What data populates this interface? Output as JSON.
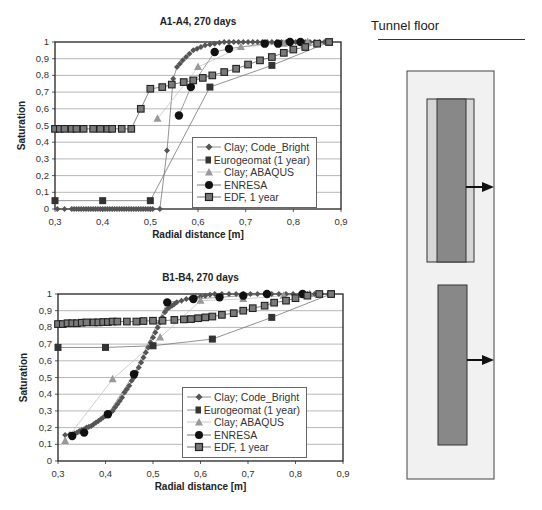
{
  "chart_data": [
    {
      "type": "scatter",
      "title": "A1-A4, 270 days",
      "xlabel": "Radial distance [m]",
      "ylabel": "Saturation",
      "xlim": [
        0.3,
        0.9
      ],
      "ylim": [
        0,
        1
      ],
      "xticks": [
        "0,3",
        "0,4",
        "0,5",
        "0,6",
        "0,7",
        "0,8",
        "0,9"
      ],
      "yticks": [
        "0",
        "0,1",
        "0,2",
        "0,3",
        "0,4",
        "0,5",
        "0,6",
        "0,7",
        "0,8",
        "0,9",
        "1"
      ],
      "grid": true,
      "legend_position": "lower right",
      "series": [
        {
          "name": "Clay; Code_Bright",
          "marker": "diamond",
          "color": "#555555",
          "x": [
            0.305,
            0.32,
            0.335,
            0.34,
            0.345,
            0.35,
            0.355,
            0.36,
            0.365,
            0.37,
            0.375,
            0.38,
            0.385,
            0.39,
            0.395,
            0.4,
            0.405,
            0.41,
            0.415,
            0.42,
            0.425,
            0.43,
            0.435,
            0.44,
            0.445,
            0.45,
            0.455,
            0.46,
            0.465,
            0.47,
            0.475,
            0.48,
            0.485,
            0.49,
            0.495,
            0.5,
            0.505,
            0.52,
            0.535,
            0.548,
            0.556,
            0.562,
            0.568,
            0.575,
            0.582,
            0.59,
            0.598,
            0.606,
            0.615,
            0.625,
            0.635,
            0.645,
            0.655,
            0.665,
            0.675,
            0.685,
            0.695,
            0.705,
            0.715,
            0.725,
            0.735,
            0.745,
            0.755,
            0.765,
            0.775,
            0.785,
            0.795,
            0.805,
            0.815,
            0.825,
            0.835,
            0.845,
            0.855,
            0.865,
            0.875
          ],
          "y": [
            0,
            0,
            0,
            0,
            0,
            0,
            0,
            0,
            0,
            0,
            0,
            0,
            0,
            0,
            0,
            0,
            0,
            0,
            0,
            0,
            0,
            0,
            0,
            0,
            0,
            0,
            0,
            0,
            0,
            0,
            0,
            0,
            0,
            0,
            0,
            0,
            0,
            0,
            0.35,
            0.78,
            0.85,
            0.87,
            0.89,
            0.91,
            0.93,
            0.95,
            0.96,
            0.97,
            0.98,
            0.985,
            0.99,
            0.995,
            1,
            1,
            1,
            1,
            1,
            1,
            1,
            1,
            1,
            1,
            1,
            1,
            1,
            1,
            1,
            1,
            1,
            1,
            1,
            1,
            1,
            1,
            1
          ]
        },
        {
          "name": "Eurogeomat  (1 year)",
          "marker": "square",
          "color": "#333333",
          "x": [
            0.3,
            0.4,
            0.5,
            0.625,
            0.755,
            0.875
          ],
          "y": [
            0.05,
            0.05,
            0.05,
            0.73,
            0.86,
            1.0
          ]
        },
        {
          "name": "Clay; ABAQUS",
          "marker": "triangle",
          "color": "#999999",
          "x": [
            0.515,
            0.6,
            0.69,
            0.78,
            0.83
          ],
          "y": [
            0.54,
            0.85,
            0.97,
            0.99,
            1.0
          ]
        },
        {
          "name": "ENRESA",
          "marker": "circle",
          "color": "#111111",
          "x": [
            0.56,
            0.585,
            0.635,
            0.665,
            0.74,
            0.768,
            0.793,
            0.815
          ],
          "y": [
            0.56,
            0.73,
            0.94,
            0.96,
            0.99,
            0.99,
            1.0,
            1.0
          ]
        },
        {
          "name": "EDF, 1 year",
          "marker": "square-open",
          "color": "#555555",
          "x": [
            0.3,
            0.31,
            0.32,
            0.335,
            0.345,
            0.36,
            0.38,
            0.395,
            0.41,
            0.42,
            0.44,
            0.46,
            0.48,
            0.5,
            0.525,
            0.545,
            0.57,
            0.59,
            0.61,
            0.63,
            0.655,
            0.68,
            0.705,
            0.73,
            0.755,
            0.78,
            0.8,
            0.825,
            0.85,
            0.875
          ],
          "y": [
            0.48,
            0.48,
            0.48,
            0.48,
            0.48,
            0.48,
            0.48,
            0.48,
            0.48,
            0.48,
            0.48,
            0.48,
            0.6,
            0.72,
            0.73,
            0.745,
            0.76,
            0.77,
            0.785,
            0.8,
            0.82,
            0.84,
            0.865,
            0.89,
            0.91,
            0.935,
            0.955,
            0.97,
            0.99,
            1.0
          ]
        }
      ]
    },
    {
      "type": "scatter",
      "title": "B1-B4, 270 days",
      "xlabel": "Radial distance [m]",
      "ylabel": "Saturation",
      "xlim": [
        0.3,
        0.9
      ],
      "ylim": [
        0,
        1
      ],
      "xticks": [
        "0,3",
        "0,4",
        "0,5",
        "0,6",
        "0,7",
        "0,8",
        "0,9"
      ],
      "yticks": [
        "0",
        "0,1",
        "0,2",
        "0,3",
        "0,4",
        "0,5",
        "0,6",
        "0,7",
        "0,8",
        "0,9",
        "1"
      ],
      "grid": true,
      "legend_position": "lower right",
      "series": [
        {
          "name": "Clay; Code_Bright",
          "marker": "diamond",
          "color": "#555555",
          "x": [
            0.315,
            0.325,
            0.335,
            0.34,
            0.345,
            0.35,
            0.355,
            0.36,
            0.365,
            0.37,
            0.375,
            0.38,
            0.385,
            0.39,
            0.395,
            0.4,
            0.405,
            0.41,
            0.415,
            0.42,
            0.425,
            0.43,
            0.435,
            0.44,
            0.445,
            0.45,
            0.455,
            0.46,
            0.465,
            0.47,
            0.475,
            0.48,
            0.485,
            0.49,
            0.495,
            0.5,
            0.505,
            0.51,
            0.515,
            0.52,
            0.525,
            0.53,
            0.535,
            0.54,
            0.545,
            0.55,
            0.56,
            0.57,
            0.58,
            0.59,
            0.6,
            0.61,
            0.62,
            0.63,
            0.645,
            0.66,
            0.675,
            0.69,
            0.705,
            0.72,
            0.735,
            0.75,
            0.765,
            0.78,
            0.795,
            0.81,
            0.825,
            0.84,
            0.855,
            0.87
          ],
          "y": [
            0.155,
            0.16,
            0.165,
            0.17,
            0.18,
            0.185,
            0.19,
            0.2,
            0.205,
            0.21,
            0.22,
            0.23,
            0.24,
            0.25,
            0.26,
            0.27,
            0.28,
            0.29,
            0.3,
            0.32,
            0.34,
            0.36,
            0.38,
            0.41,
            0.43,
            0.45,
            0.48,
            0.5,
            0.53,
            0.56,
            0.59,
            0.62,
            0.65,
            0.68,
            0.71,
            0.74,
            0.77,
            0.8,
            0.83,
            0.86,
            0.89,
            0.91,
            0.92,
            0.93,
            0.94,
            0.95,
            0.96,
            0.97,
            0.975,
            0.98,
            0.985,
            0.99,
            0.995,
            1,
            1,
            1,
            1,
            1,
            1,
            1,
            1,
            1,
            1,
            1,
            1,
            1,
            1,
            1,
            1,
            1
          ]
        },
        {
          "name": "Eurogeomat  (1 year)",
          "marker": "square",
          "color": "#333333",
          "x": [
            0.3,
            0.4,
            0.5,
            0.625,
            0.75,
            0.875
          ],
          "y": [
            0.68,
            0.68,
            0.69,
            0.73,
            0.86,
            1.0
          ]
        },
        {
          "name": "Clay; ABAQUS",
          "marker": "triangle",
          "color": "#999999",
          "x": [
            0.315,
            0.415,
            0.515,
            0.6,
            0.69,
            0.775,
            0.83
          ],
          "y": [
            0.12,
            0.49,
            0.74,
            0.96,
            0.97,
            0.99,
            1.0
          ]
        },
        {
          "name": "ENRESA",
          "marker": "circle",
          "color": "#111111",
          "x": [
            0.33,
            0.355,
            0.405,
            0.46,
            0.53,
            0.585,
            0.64,
            0.69,
            0.74,
            0.815
          ],
          "y": [
            0.15,
            0.17,
            0.28,
            0.52,
            0.95,
            0.97,
            0.98,
            0.99,
            1.0,
            1.0
          ]
        },
        {
          "name": "EDF, 1 year",
          "marker": "square-open",
          "color": "#555555",
          "x": [
            0.3,
            0.31,
            0.32,
            0.33,
            0.34,
            0.35,
            0.36,
            0.375,
            0.385,
            0.395,
            0.405,
            0.415,
            0.425,
            0.445,
            0.465,
            0.48,
            0.5,
            0.52,
            0.545,
            0.565,
            0.58,
            0.595,
            0.61,
            0.625,
            0.645,
            0.67,
            0.69,
            0.71,
            0.735,
            0.755,
            0.78,
            0.8,
            0.825,
            0.85,
            0.875
          ],
          "y": [
            0.82,
            0.82,
            0.825,
            0.825,
            0.825,
            0.828,
            0.83,
            0.83,
            0.83,
            0.832,
            0.832,
            0.835,
            0.835,
            0.835,
            0.835,
            0.838,
            0.84,
            0.84,
            0.845,
            0.848,
            0.85,
            0.855,
            0.86,
            0.865,
            0.875,
            0.885,
            0.9,
            0.915,
            0.93,
            0.948,
            0.96,
            0.975,
            0.99,
            1.0,
            1.0
          ]
        }
      ]
    }
  ],
  "diagram": {
    "title": "Tunnel floor"
  }
}
